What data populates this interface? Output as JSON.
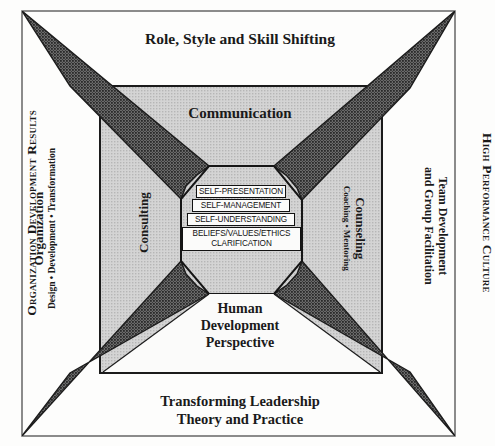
{
  "figure": {
    "top_title": "TRANSFORMATIONAL DEVELOPMENT MODEL",
    "top_caption": "Role, Style and Skill Shifting",
    "bottom_caption_line1": "Transforming Leadership",
    "bottom_caption_line2": "Theory and Practice",
    "left_outer_caption": "Organization Development Results",
    "right_outer_caption": "High Performance Culture",
    "left_inner_title": "Organization",
    "left_inner_subtitle": "Design • Development • Transformation",
    "right_inner_line1": "Team Development",
    "right_inner_line2": "and Group Facilitation",
    "box_top_label": "Communication",
    "box_left_label": "Consulting",
    "box_right_label": "Counseling",
    "box_right_sublabel": "Coaching • Mentoring",
    "box_bottom_line1": "Human",
    "box_bottom_line2": "Development",
    "box_bottom_line3": "Perspective"
  },
  "core_boxes": [
    {
      "label": "SELF-PRESENTATION"
    },
    {
      "label": "SELF-MANAGEMENT"
    },
    {
      "label": "SELF-UNDERSTANDING"
    },
    {
      "label_line1": "BELIEFS/VALUES/ETHICS",
      "label_line2": "CLARIFICATION"
    }
  ],
  "colors": {
    "page_background": "#fdfdfc",
    "frame_stroke": "#6f6f6f",
    "gray_panel_fill": "#c8c8c8",
    "star_fill": "#4a4a4a",
    "octagon_fill": "#c8c8c8",
    "box_stroke": "#121212",
    "text": "#1a1a1a"
  }
}
